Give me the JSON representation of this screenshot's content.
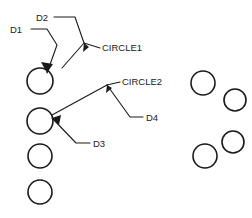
{
  "drawing": {
    "width": 252,
    "height": 218,
    "background_color": "#ffffff",
    "line_color": "#1a1a1a",
    "labels": {
      "d1": "D1",
      "d2": "D2",
      "d3": "D3",
      "d4": "D4",
      "circle1": "CIRCLE1",
      "circle2": "CIRCLE2"
    },
    "circles": [
      {
        "name": "left-circle-1",
        "cx": 40,
        "cy": 81,
        "r": 13
      },
      {
        "name": "left-circle-2",
        "cx": 40,
        "cy": 121,
        "r": 13
      },
      {
        "name": "left-circle-3",
        "cx": 40,
        "cy": 156,
        "r": 12
      },
      {
        "name": "left-circle-4",
        "cx": 40,
        "cy": 192,
        "r": 12
      },
      {
        "name": "right-circle-1",
        "cx": 203,
        "cy": 83,
        "r": 12
      },
      {
        "name": "right-circle-2",
        "cx": 235,
        "cy": 100,
        "r": 11
      },
      {
        "name": "right-circle-3",
        "cx": 233,
        "cy": 142,
        "r": 11
      },
      {
        "name": "right-circle-4",
        "cx": 205,
        "cy": 156,
        "r": 12
      }
    ],
    "leaders": [
      {
        "name": "leader-d1",
        "label": "D1",
        "path": "M 31 29 L 47 29 L 57 45 L 47 73",
        "label_x": 10,
        "label_y": 30,
        "arrow": "M 47 73 L 41 62 L 53 64 Z"
      },
      {
        "name": "leader-d2",
        "label": "D2",
        "path": "M 54 17 L 75 17 L 84 43",
        "label_x": 36,
        "label_y": 18,
        "arrow": ""
      },
      {
        "name": "leader-circle1",
        "label": "CIRCLE1",
        "path": "M 84 43 L 100 48",
        "label_x": 102,
        "label_y": 48,
        "arrow": "M 84 43 L 83 52 L 89 47 Z"
      },
      {
        "name": "leader-circle1-stem",
        "label": "",
        "path": "M 84 43 L 62 68",
        "label_x": 0,
        "label_y": 0,
        "arrow": ""
      },
      {
        "name": "leader-circle2",
        "label": "CIRCLE2",
        "path": "M 107 85 L 120 82",
        "label_x": 122,
        "label_y": 82,
        "arrow": "M 107 85 L 106 93 L 112 88 Z"
      },
      {
        "name": "leader-d4",
        "label": "D4",
        "path": "M 107 85 L 130 117 L 143 117",
        "label_x": 146,
        "label_y": 118,
        "arrow": ""
      },
      {
        "name": "leader-d3",
        "label": "D3",
        "path": "M 52 118 L 76 143 L 90 143",
        "label_x": 93,
        "label_y": 144,
        "arrow": "M 52 118 L 61 115 L 59 125 Z"
      },
      {
        "name": "leader-circle2-stem",
        "label": "",
        "path": "M 107 85 L 52 115",
        "label_x": 0,
        "label_y": 0,
        "arrow": ""
      }
    ]
  }
}
